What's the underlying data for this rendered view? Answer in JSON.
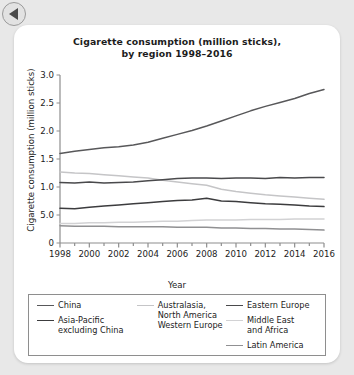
{
  "nav": {
    "back_icon": "back-arrow-icon"
  },
  "chart_data": {
    "type": "line",
    "title": "Cigarette consumption (million sticks),\nby region 1998–2016",
    "title_line1": "Cigarette consumption (million sticks),",
    "title_line2": "by region 1998–2016",
    "xlabel": "Year",
    "ylabel": "Cigarette consumption (million sticks)",
    "grid": false,
    "legend_position": "bottom",
    "xlim": [
      1998,
      2016
    ],
    "ylim": [
      0,
      3.0
    ],
    "ytick_labels": [
      "3.0",
      "2.5",
      "2.0",
      "1.5",
      "1.0",
      "5.0",
      "0"
    ],
    "ytick_values": [
      3.0,
      2.5,
      2.0,
      1.5,
      1.0,
      0.5,
      0
    ],
    "xtick_labels": [
      "1998",
      "2000",
      "2002",
      "2004",
      "2006",
      "2008",
      "2010",
      "2012",
      "2014",
      "2016"
    ],
    "xtick_values": [
      1998,
      2000,
      2002,
      2004,
      2006,
      2008,
      2010,
      2012,
      2014,
      2016
    ],
    "x": [
      1998,
      1999,
      2000,
      2001,
      2002,
      2003,
      2004,
      2005,
      2006,
      2007,
      2008,
      2009,
      2010,
      2011,
      2012,
      2013,
      2014,
      2015,
      2016
    ],
    "series": [
      {
        "name": "China",
        "color": "#58585a",
        "width": 1.5,
        "values": [
          1.6,
          1.64,
          1.67,
          1.7,
          1.72,
          1.75,
          1.8,
          1.87,
          1.94,
          2.01,
          2.09,
          2.18,
          2.27,
          2.36,
          2.44,
          2.51,
          2.58,
          2.67,
          2.74
        ]
      },
      {
        "name": "Asia-Pacific excluding China",
        "color": "#3c3c3e",
        "width": 1.5,
        "values": [
          0.62,
          0.61,
          0.64,
          0.66,
          0.68,
          0.7,
          0.72,
          0.74,
          0.76,
          0.77,
          0.8,
          0.75,
          0.74,
          0.72,
          0.7,
          0.69,
          0.68,
          0.66,
          0.65
        ]
      },
      {
        "name": "Australasia, North America Western Europe",
        "color": "#c5c5c7",
        "width": 1.5,
        "values": [
          1.27,
          1.25,
          1.24,
          1.22,
          1.2,
          1.18,
          1.16,
          1.12,
          1.09,
          1.06,
          1.03,
          0.96,
          0.92,
          0.89,
          0.86,
          0.84,
          0.82,
          0.8,
          0.78
        ]
      },
      {
        "name": "Eastern Europe",
        "color": "#4a4a4c",
        "width": 1.5,
        "values": [
          1.08,
          1.07,
          1.09,
          1.07,
          1.08,
          1.09,
          1.11,
          1.13,
          1.15,
          1.16,
          1.16,
          1.15,
          1.16,
          1.16,
          1.15,
          1.17,
          1.16,
          1.17,
          1.17
        ]
      },
      {
        "name": "Middle East and Africa",
        "color": "#d2d2d4",
        "width": 1.5,
        "values": [
          0.35,
          0.35,
          0.36,
          0.36,
          0.37,
          0.37,
          0.38,
          0.39,
          0.39,
          0.4,
          0.41,
          0.41,
          0.41,
          0.42,
          0.42,
          0.42,
          0.43,
          0.43,
          0.43
        ]
      },
      {
        "name": "Latin America",
        "color": "#909092",
        "width": 1.5,
        "values": [
          0.31,
          0.3,
          0.3,
          0.3,
          0.29,
          0.29,
          0.29,
          0.29,
          0.28,
          0.28,
          0.28,
          0.27,
          0.27,
          0.26,
          0.26,
          0.25,
          0.25,
          0.24,
          0.23
        ]
      }
    ]
  },
  "legend": {
    "col1": [
      {
        "label": "China",
        "color": "#58585a"
      },
      {
        "label": "Asia-Pacific\nexcluding China",
        "color": "#3c3c3e"
      }
    ],
    "col2": [
      {
        "label": "Australasia,\nNorth America\nWestern Europe",
        "color": "#c5c5c7"
      }
    ],
    "col3": [
      {
        "label": "Eastern Europe",
        "color": "#4a4a4c"
      },
      {
        "label": "Middle East\nand Africa",
        "color": "#d2d2d4"
      },
      {
        "label": "Latin America",
        "color": "#909092"
      }
    ]
  }
}
